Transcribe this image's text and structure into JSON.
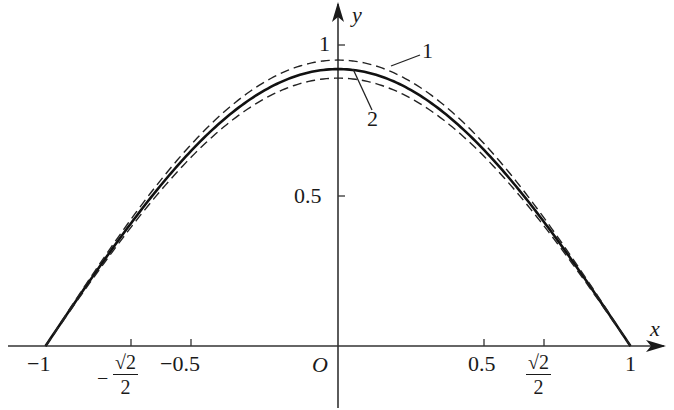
{
  "chart_data": {
    "type": "line",
    "title": "",
    "xlabel": "x",
    "ylabel": "y",
    "origin_label": "O",
    "xlim": [
      -1.05,
      1.1
    ],
    "ylim": [
      -0.1,
      1.1
    ],
    "grid": false,
    "legend": "inline numbered leader labels",
    "x_ticks": [
      {
        "value": -1,
        "label": "-1"
      },
      {
        "value": -0.7071,
        "label": "-√2/2"
      },
      {
        "value": -0.5,
        "label": "-0.5"
      },
      {
        "value": 0.5,
        "label": "0.5"
      },
      {
        "value": 0.7071,
        "label": "√2/2"
      },
      {
        "value": 1,
        "label": "1"
      }
    ],
    "y_ticks": [
      {
        "value": 0.5,
        "label": "0.5"
      },
      {
        "value": 1,
        "label": "1"
      }
    ],
    "series": [
      {
        "name": "solid",
        "style": "solid",
        "label": "",
        "x": [
          -1,
          -0.75,
          -0.5,
          -0.25,
          0,
          0.25,
          0.5,
          0.75,
          1
        ],
        "y": [
          0,
          0.35,
          0.65,
          0.85,
          0.92,
          0.85,
          0.65,
          0.35,
          0
        ]
      },
      {
        "name": "1",
        "style": "dashed",
        "label": "1",
        "x": [
          -1,
          -0.75,
          -0.5,
          -0.25,
          0,
          0.25,
          0.5,
          0.75,
          1
        ],
        "y": [
          0,
          0.36,
          0.67,
          0.88,
          0.95,
          0.88,
          0.67,
          0.36,
          0
        ]
      },
      {
        "name": "2",
        "style": "dashed",
        "label": "2",
        "x": [
          -1,
          -0.75,
          -0.5,
          -0.25,
          0,
          0.25,
          0.5,
          0.75,
          1
        ],
        "y": [
          0,
          0.34,
          0.63,
          0.82,
          0.89,
          0.82,
          0.63,
          0.34,
          0
        ]
      }
    ]
  },
  "labels": {
    "x_axis": "x",
    "y_axis": "y",
    "origin": "O",
    "y_tick_1": "1",
    "y_tick_half": "0.5",
    "x_tick_neg1": "−1",
    "x_tick_neg_half": "−0.5",
    "x_tick_half": "0.5",
    "x_tick_1": "1",
    "sqrt2_num": "√2",
    "sqrt2_den": "2",
    "minus": "−",
    "curve1": "1",
    "curve2": "2"
  }
}
